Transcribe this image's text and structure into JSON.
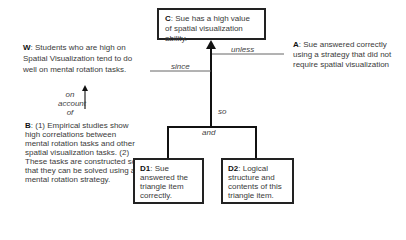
{
  "diagram": {
    "type": "toulmin-argument",
    "claim": {
      "label": "C",
      "text": ": Sue has a high value of spatial visualization ability."
    },
    "warrant": {
      "label": "W",
      "text": ": Students who are high on Spatial Visualization tend to do well on mental rotation tasks."
    },
    "alternative": {
      "label": "A",
      "text": ": Sue answered correctly using a strategy that did not require spatial visualization"
    },
    "backing": {
      "label": "B",
      "text": ": (1) Empirical studies show high correlations between mental rotation tasks and other spatial visualization tasks. (2) These tasks are constructed so that they can be solved using a mental rotation strategy."
    },
    "data1": {
      "label": "D1",
      "text": ": Sue answered the triangle item correctly."
    },
    "data2": {
      "label": "D2",
      "text": ": Logical structure and contents of this triangle item."
    },
    "connectors": {
      "unless": "unless",
      "since": "since",
      "on_account_of": "on account of",
      "so": "so",
      "and": "and"
    }
  }
}
